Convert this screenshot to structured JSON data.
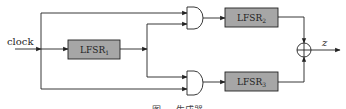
{
  "diagram": {
    "type": "shrinking/combination generator block diagram",
    "input": {
      "label": "clock"
    },
    "blocks": [
      {
        "id": "lfsr1",
        "label": "LFSR",
        "subscript": "1"
      },
      {
        "id": "lfsr2",
        "label": "LFSR",
        "subscript": "2"
      },
      {
        "id": "lfsr3",
        "label": "LFSR",
        "subscript": "3"
      }
    ],
    "gates": [
      {
        "id": "and-top",
        "type": "AND"
      },
      {
        "id": "and-bottom",
        "type": "AND"
      },
      {
        "id": "xor-out",
        "type": "XOR"
      }
    ],
    "output": {
      "label": "z"
    },
    "caption": "图 … 生成器",
    "colors": {
      "block_fill": "#a6a6a6",
      "line": "#222222",
      "background": "#ffffff"
    }
  }
}
